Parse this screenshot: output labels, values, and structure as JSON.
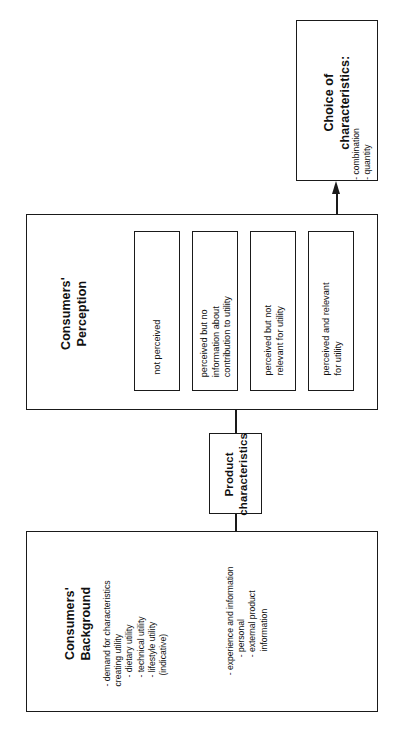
{
  "figure": {
    "orientation": "rotated-90-ccw",
    "background_color": "#ffffff",
    "line_color": "#1a1a1a"
  },
  "nodes": {
    "choice": {
      "title_line1": "Choice of",
      "title_line2": "characteristics:",
      "items": [
        "- combination",
        "- quantity"
      ]
    },
    "perception": {
      "title_line1": "Consumers'",
      "title_line2": "Perception",
      "categories": [
        {
          "lines": [
            "not perceived"
          ]
        },
        {
          "lines": [
            "perceived but no",
            "information about",
            "contribution to utility"
          ]
        },
        {
          "lines": [
            "perceived but not",
            "relevant for utility"
          ]
        },
        {
          "lines": [
            "perceived and relevant",
            "for utility"
          ]
        }
      ]
    },
    "product": {
      "title_line1": "Product",
      "title_line2": "characteristics"
    },
    "background": {
      "title_line1": "Consumers'",
      "title_line2": "Background",
      "group_one": [
        "- demand for characteristics",
        "creating utility",
        "- dietary utility",
        "- technical utility",
        "- lifestyle utility",
        "(indicative)"
      ],
      "group_two": [
        "- experience and information",
        "- personal",
        "- external product",
        "information"
      ]
    }
  },
  "connectors": {
    "product_to_perception": "line",
    "product_to_background": "line",
    "perception_to_choice": "arrow"
  }
}
